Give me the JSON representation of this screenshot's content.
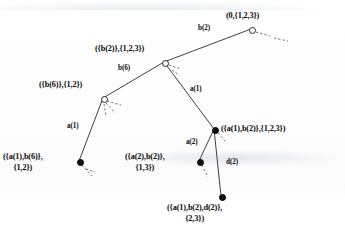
{
  "figure": {
    "type": "tree-diagram",
    "title": "",
    "width": 345,
    "height": 243,
    "background_color": "#ffffff",
    "line_color": "#2a2a2a",
    "text_color": "#0b0b0b"
  },
  "legend": {
    "open_node_meaning": "open circle node",
    "closed_node_meaning": "filled circle node"
  },
  "nodes": [
    {
      "id": "root",
      "label_line1": "(0,{1,2,3})",
      "label_line2": "",
      "marker": "open",
      "x": 251,
      "y": 29,
      "label_x": 226,
      "label_y": 11,
      "label_align": "left"
    },
    {
      "id": "b2",
      "label_line1": "({b(2)},{1,2,3})",
      "label_line2": "",
      "marker": "open",
      "x": 164,
      "y": 62,
      "label_x": 95,
      "label_y": 44,
      "label_align": "left"
    },
    {
      "id": "b6",
      "label_line1": "({b(6)},{1,2})",
      "label_line2": "",
      "marker": "open",
      "x": 103,
      "y": 98,
      "label_x": 39,
      "label_y": 80,
      "label_align": "left"
    },
    {
      "id": "a1b6",
      "label_line1": "({a(1),b(6)},",
      "label_line2": "{1,2})",
      "marker": "closed",
      "x": 79,
      "y": 161,
      "label_x": 3,
      "label_y": 152,
      "label_align": "left"
    },
    {
      "id": "a1b2",
      "label_line1": "({a(1),b(2)},{1,2,3})",
      "label_line2": "",
      "marker": "closed",
      "x": 214,
      "y": 129,
      "label_x": 221,
      "label_y": 124,
      "label_align": "left"
    },
    {
      "id": "a2b2",
      "label_line1": "({a(2),b(2)},",
      "label_line2": "{1,3})",
      "marker": "closed",
      "x": 199,
      "y": 161,
      "label_x": 125,
      "label_y": 152,
      "label_align": "left"
    },
    {
      "id": "a1b2d2",
      "label_line1": "({a(1),b(2),d(2)},",
      "label_line2": "{2,3})",
      "marker": "closed",
      "x": 221,
      "y": 196,
      "label_x": 167,
      "label_y": 203,
      "label_align": "left"
    }
  ],
  "edges": [
    {
      "id": "e-root-b2",
      "from": "root",
      "to": "b2",
      "label": "b(2)",
      "label_x": 198,
      "label_y": 24
    },
    {
      "id": "e-b2-b6",
      "from": "b2",
      "to": "b6",
      "label": "b(6)",
      "label_x": 118,
      "label_y": 64
    },
    {
      "id": "e-b2-a1b2",
      "from": "b2",
      "to": "a1b2",
      "label": "a(1)",
      "label_x": 190,
      "label_y": 85
    },
    {
      "id": "e-b6-a1b6",
      "from": "b6",
      "to": "a1b6",
      "label": "a(1)",
      "label_x": 67,
      "label_y": 122
    },
    {
      "id": "e-a1b2-a2b2",
      "from": "a1b2",
      "to": "a2b2",
      "label": "a(2)",
      "label_x": 186,
      "label_y": 138
    },
    {
      "id": "e-a1b2-d2",
      "from": "a1b2",
      "to": "a1b2d2",
      "label": "d(2)",
      "label_x": 226,
      "label_y": 158
    }
  ],
  "dashed_stubs": [
    {
      "id": "stub-root-1",
      "x1": 256,
      "y1": 32,
      "x2": 270,
      "y2": 36
    },
    {
      "id": "stub-root-2",
      "x1": 274,
      "y1": 38,
      "x2": 288,
      "y2": 41
    },
    {
      "id": "stub-b2-1",
      "x1": 169,
      "y1": 65,
      "x2": 181,
      "y2": 69
    },
    {
      "id": "stub-b2-2",
      "x1": 172,
      "y1": 70,
      "x2": 179,
      "y2": 75
    },
    {
      "id": "stub-b6-1",
      "x1": 107,
      "y1": 101,
      "x2": 121,
      "y2": 105
    },
    {
      "id": "stub-b6-2",
      "x1": 106,
      "y1": 103,
      "x2": 115,
      "y2": 113
    },
    {
      "id": "stub-b6-3",
      "x1": 104,
      "y1": 104,
      "x2": 106,
      "y2": 116
    },
    {
      "id": "stub-a1b6-1",
      "x1": 82,
      "y1": 165,
      "x2": 92,
      "y2": 176
    },
    {
      "id": "stub-a1b6-2",
      "x1": 86,
      "y1": 169,
      "x2": 95,
      "y2": 172
    },
    {
      "id": "stub-a2b2-1",
      "x1": 202,
      "y1": 165,
      "x2": 208,
      "y2": 177
    },
    {
      "id": "stub-a1b2-1",
      "x1": 218,
      "y1": 133,
      "x2": 226,
      "y2": 142
    }
  ]
}
